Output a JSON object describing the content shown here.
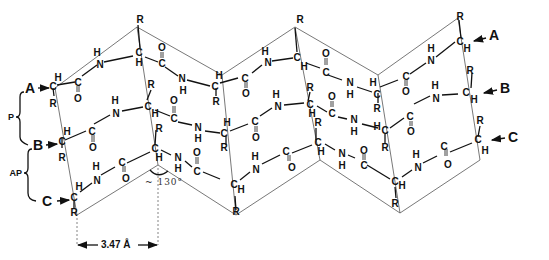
{
  "figure": {
    "strands": [
      {
        "id": "A",
        "label": "A"
      },
      {
        "id": "B",
        "label": "B"
      },
      {
        "id": "C",
        "label": "C"
      }
    ],
    "braces": [
      {
        "id": "P",
        "label": "P",
        "spans": "A–B",
        "meaning": "parallel"
      },
      {
        "id": "AP",
        "label": "AP",
        "spans": "B–C",
        "meaning": "antiparallel"
      }
    ],
    "annotations": {
      "angle": "~ 130°",
      "distance": "3.47 Å"
    },
    "atom_symbols": {
      "carbon": "C",
      "hydrogen": "H",
      "nitrogen": "N",
      "oxygen": "O",
      "side_chain": "R"
    }
  },
  "labels": {
    "strand_A_left": "A",
    "strand_B_left": "B",
    "strand_C_left": "C",
    "strand_A_right": "A",
    "strand_B_right": "B",
    "strand_C_right": "C",
    "brace_P": "P",
    "brace_AP": "AP",
    "angle": "~ 130°",
    "distance": "3.47 Å"
  }
}
